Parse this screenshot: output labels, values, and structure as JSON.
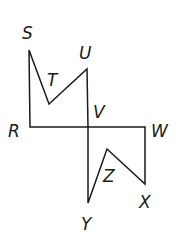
{
  "diagram": {
    "type": "geometry-figure",
    "colors": {
      "stroke": "#1a1a1a",
      "background": "#ffffff"
    },
    "polygons": [
      {
        "name": "RSTUV",
        "vertices": [
          "R",
          "S",
          "T",
          "U",
          "V"
        ]
      },
      {
        "name": "VWXZY",
        "vertices": [
          "V",
          "W",
          "X",
          "Z",
          "Y"
        ]
      }
    ],
    "labels": {
      "S": "S",
      "T": "T",
      "U": "U",
      "V": "V",
      "R": "R",
      "W": "W",
      "Z": "Z",
      "X": "X",
      "Y": "Y"
    }
  }
}
